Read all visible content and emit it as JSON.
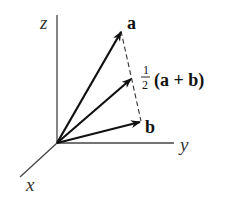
{
  "diagram": {
    "type": "3d-vector-diagram",
    "axes": {
      "x": {
        "label": "x"
      },
      "y": {
        "label": "y"
      },
      "z": {
        "label": "z"
      }
    },
    "vectors": [
      {
        "name": "a",
        "label": "a"
      },
      {
        "name": "midpoint",
        "label_fraction_num": "1",
        "label_fraction_den": "2",
        "label_expr": "(a + b)"
      },
      {
        "name": "b",
        "label": "b"
      }
    ],
    "connector": {
      "style": "dashed",
      "from": "a",
      "to": "b"
    },
    "colors": {
      "line": "#111111",
      "axis": "#333333",
      "background": "#ffffff"
    }
  }
}
